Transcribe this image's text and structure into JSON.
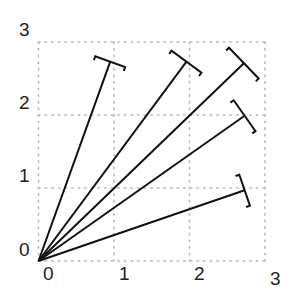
{
  "chart_data": {
    "type": "vector-field",
    "title": "",
    "xlabel": "",
    "ylabel": "",
    "xlim": [
      0,
      3
    ],
    "ylim": [
      0,
      3
    ],
    "grid": true,
    "grid_style": "dotted",
    "x_ticks": [
      "0",
      "1",
      "2",
      "3"
    ],
    "y_ticks": [
      "0",
      "1",
      "2",
      "3"
    ],
    "origin": [
      0,
      0
    ],
    "vectors": [
      {
        "x0": 0,
        "y0": 0,
        "x1": 0.95,
        "y1": 2.73
      },
      {
        "x0": 0,
        "y0": 0,
        "x1": 1.96,
        "y1": 2.73
      },
      {
        "x0": 0,
        "y0": 0,
        "x1": 2.72,
        "y1": 2.71
      },
      {
        "x0": 0,
        "y0": 0,
        "x1": 2.73,
        "y1": 1.99
      },
      {
        "x0": 0,
        "y0": 0,
        "x1": 2.73,
        "y1": 0.97
      }
    ],
    "end_marker": "T-bar",
    "colors": {
      "vector": "#111111",
      "grid": "#bbbbbb",
      "text": "#222222"
    }
  },
  "axes": {
    "x_tick_labels": [
      "0",
      "1",
      "2",
      "3"
    ],
    "y_tick_labels": [
      "0",
      "1",
      "2",
      "3"
    ]
  }
}
